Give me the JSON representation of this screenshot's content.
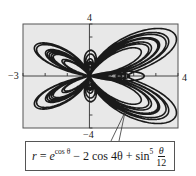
{
  "chart_data": {
    "type": "line",
    "subtype": "polar",
    "title": "",
    "equation": "r = e^{cos θ} − 2 cos 4θ + sin^5(θ/12)",
    "theta_range": [
      0,
      75.398
    ],
    "xlim": [
      -3,
      4
    ],
    "ylim": [
      -4,
      4
    ],
    "xticks": [
      -3,
      -2,
      -1,
      0,
      1,
      2,
      3,
      4
    ],
    "yticks": [
      -4,
      -3,
      -2,
      -1,
      0,
      1,
      2,
      3,
      4
    ],
    "xlabel": "",
    "ylabel": "",
    "grid": false,
    "legend": "none",
    "plot_background": "#e8e8e8",
    "line_color": "#1a1a1a"
  },
  "axis_labels": {
    "x_min": "−3",
    "x_max": "4",
    "y_max": "4",
    "y_min": "−4"
  },
  "formula": {
    "lhs": "r",
    "eq": " = ",
    "base": "e",
    "exp": "cos θ",
    "term2": " − 2 cos 4θ + sin",
    "power": "5",
    "frac_num": "θ",
    "frac_den": "12"
  }
}
